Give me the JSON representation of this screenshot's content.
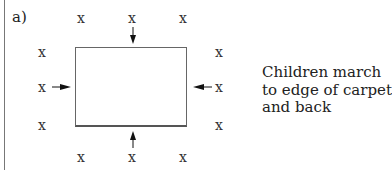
{
  "diagram": {
    "label": "a)",
    "caption_lines": [
      "Children march",
      "to edge of carpet",
      "and back"
    ],
    "marker": "x",
    "markers": {
      "top": [
        {
          "x": 76,
          "y": 11
        },
        {
          "x": 127,
          "y": 11
        },
        {
          "x": 178,
          "y": 11
        }
      ],
      "left": [
        {
          "x": 37,
          "y": 45
        },
        {
          "x": 37,
          "y": 80
        },
        {
          "x": 37,
          "y": 118
        }
      ],
      "right": [
        {
          "x": 214,
          "y": 45
        },
        {
          "x": 214,
          "y": 80
        },
        {
          "x": 214,
          "y": 118
        }
      ],
      "bottom": [
        {
          "x": 76,
          "y": 150
        },
        {
          "x": 127,
          "y": 150
        },
        {
          "x": 178,
          "y": 150
        }
      ]
    },
    "arrows": [
      {
        "name": "arrow-down-icon",
        "direction": "down"
      },
      {
        "name": "arrow-right-icon",
        "direction": "right"
      },
      {
        "name": "arrow-left-icon",
        "direction": "left"
      },
      {
        "name": "arrow-up-icon",
        "direction": "up"
      }
    ],
    "carpet_label": "carpet"
  }
}
